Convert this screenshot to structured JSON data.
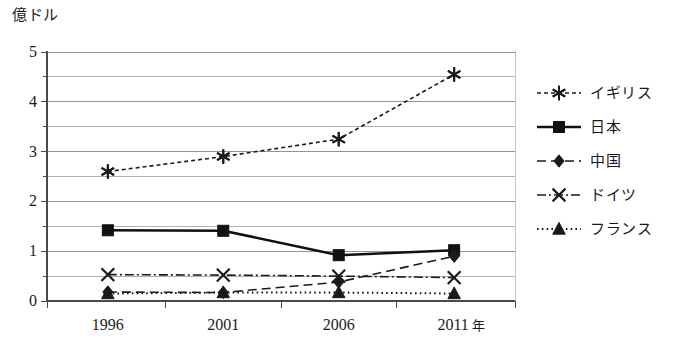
{
  "chart_data": {
    "type": "line",
    "title": "",
    "ylabel": "億ドル",
    "xlabel": "年",
    "categories": [
      "1996",
      "2001",
      "2006",
      "2011"
    ],
    "x_tick_labels": [
      "1996",
      "2001",
      "2006",
      "2011"
    ],
    "x_unit_suffix": "年",
    "y_tick_labels": [
      "0",
      "1",
      "2",
      "3",
      "4",
      "5"
    ],
    "ylim": [
      0,
      5
    ],
    "y_major_step": 1,
    "y_minor_step": 0.5,
    "grid": "horizontal",
    "legend_position": "right",
    "series": [
      {
        "name": "イギリス",
        "marker": "asterisk",
        "line_style": "dashed",
        "color": "#1a1a1a",
        "values": [
          2.6,
          2.9,
          3.25,
          4.55
        ]
      },
      {
        "name": "日本",
        "marker": "square",
        "line_style": "solid",
        "color": "#111111",
        "values": [
          1.42,
          1.41,
          0.92,
          1.02
        ]
      },
      {
        "name": "中国",
        "marker": "diamond",
        "line_style": "dashed-long",
        "color": "#1a1a1a",
        "values": [
          0.18,
          0.17,
          0.38,
          0.9
        ]
      },
      {
        "name": "ドイツ",
        "marker": "x-cross",
        "line_style": "dash-dot",
        "color": "#1a1a1a",
        "values": [
          0.53,
          0.52,
          0.5,
          0.47
        ]
      },
      {
        "name": "フランス",
        "marker": "triangle",
        "line_style": "dotted",
        "color": "#1a1a1a",
        "values": [
          0.15,
          0.17,
          0.17,
          0.15
        ]
      }
    ]
  },
  "legend": {
    "items": [
      {
        "label": "イギリス"
      },
      {
        "label": "日本"
      },
      {
        "label": "中国"
      },
      {
        "label": "ドイツ"
      },
      {
        "label": "フランス"
      }
    ]
  },
  "colors": {
    "ink": "#1a1a1a",
    "gridline": "#8a8a8a",
    "axis": "#4a4a4a",
    "background": "#ffffff"
  }
}
